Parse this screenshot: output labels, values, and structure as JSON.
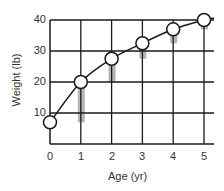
{
  "chart_data": {
    "type": "line",
    "title": "",
    "xlabel": "Age (yr)",
    "ylabel": "Weight (lb)",
    "x": [
      0,
      1,
      2,
      3,
      4,
      5
    ],
    "series": [
      {
        "name": "Weight",
        "values": [
          7,
          20,
          27.5,
          32.5,
          37,
          40
        ]
      }
    ],
    "increments": {
      "name": "Yearly weight gain (gray bars)",
      "x": [
        1,
        2,
        3,
        4,
        5
      ],
      "values": [
        13,
        7.5,
        5,
        4.5,
        3
      ]
    },
    "x_ticks": [
      "0",
      "1",
      "2",
      "3",
      "4",
      "5"
    ],
    "y_ticks": [
      "10",
      "20",
      "30",
      "40"
    ],
    "xlim": [
      0,
      5
    ],
    "ylim": [
      0,
      40
    ],
    "grid": true,
    "legend": null
  },
  "axes": {
    "xlabel": "Age (yr)",
    "ylabel": "Weight (lb)",
    "x_ticks": [
      "0",
      "1",
      "2",
      "3",
      "4",
      "5"
    ],
    "y_ticks": [
      "10",
      "20",
      "30",
      "40"
    ]
  },
  "colors": {
    "line": "#1a1a1a",
    "grid": "#1a1a1a",
    "bar": "#b5b5b5",
    "marker_fill": "#ffffff"
  }
}
